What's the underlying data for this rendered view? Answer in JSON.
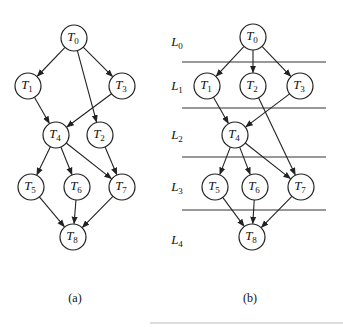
{
  "figure": {
    "panels": [
      {
        "id": "a",
        "caption": "(a)",
        "nodes": [
          {
            "id": "T0",
            "label": "T",
            "sub": "0",
            "x": 74,
            "y": 38
          },
          {
            "id": "T1",
            "label": "T",
            "sub": "1",
            "x": 28,
            "y": 86
          },
          {
            "id": "T3",
            "label": "T",
            "sub": "3",
            "x": 122,
            "y": 86
          },
          {
            "id": "T4",
            "label": "T",
            "sub": "4",
            "x": 56,
            "y": 135
          },
          {
            "id": "T2",
            "label": "T",
            "sub": "2",
            "x": 100,
            "y": 135
          },
          {
            "id": "T5",
            "label": "T",
            "sub": "5",
            "x": 31,
            "y": 187
          },
          {
            "id": "T6",
            "label": "T",
            "sub": "6",
            "x": 77,
            "y": 187
          },
          {
            "id": "T7",
            "label": "T",
            "sub": "7",
            "x": 122,
            "y": 187
          },
          {
            "id": "T8",
            "label": "T",
            "sub": "8",
            "x": 73,
            "y": 237
          }
        ],
        "edges": [
          [
            "T0",
            "T1"
          ],
          [
            "T0",
            "T3"
          ],
          [
            "T0",
            "T2"
          ],
          [
            "T1",
            "T4"
          ],
          [
            "T3",
            "T4"
          ],
          [
            "T4",
            "T5"
          ],
          [
            "T4",
            "T6"
          ],
          [
            "T4",
            "T7"
          ],
          [
            "T2",
            "T7"
          ],
          [
            "T5",
            "T8"
          ],
          [
            "T6",
            "T8"
          ],
          [
            "T7",
            "T8"
          ]
        ]
      },
      {
        "id": "b",
        "caption": "(b)",
        "levels": [
          {
            "label": "L",
            "sub": "0",
            "y": 42
          },
          {
            "label": "L",
            "sub": "1",
            "y": 86
          },
          {
            "label": "L",
            "sub": "2",
            "y": 135
          },
          {
            "label": "L",
            "sub": "3",
            "y": 187
          },
          {
            "label": "L",
            "sub": "4",
            "y": 240
          }
        ],
        "level_lines_y": [
          62,
          108,
          157,
          210
        ],
        "nodes": [
          {
            "id": "T0",
            "label": "T",
            "sub": "0",
            "x": 253,
            "y": 37
          },
          {
            "id": "T1",
            "label": "T",
            "sub": "1",
            "x": 207,
            "y": 86
          },
          {
            "id": "T2",
            "label": "T",
            "sub": "2",
            "x": 253,
            "y": 86
          },
          {
            "id": "T3",
            "label": "T",
            "sub": "3",
            "x": 300,
            "y": 86
          },
          {
            "id": "T4",
            "label": "T",
            "sub": "4",
            "x": 235,
            "y": 135
          },
          {
            "id": "T5",
            "label": "T",
            "sub": "5",
            "x": 215,
            "y": 187
          },
          {
            "id": "T6",
            "label": "T",
            "sub": "6",
            "x": 255,
            "y": 187
          },
          {
            "id": "T7",
            "label": "T",
            "sub": "7",
            "x": 301,
            "y": 187
          },
          {
            "id": "T8",
            "label": "T",
            "sub": "8",
            "x": 252,
            "y": 237
          }
        ],
        "edges": [
          [
            "T0",
            "T1"
          ],
          [
            "T0",
            "T2"
          ],
          [
            "T0",
            "T3"
          ],
          [
            "T1",
            "T4"
          ],
          [
            "T3",
            "T4"
          ],
          [
            "T2",
            "T7"
          ],
          [
            "T4",
            "T5"
          ],
          [
            "T4",
            "T6"
          ],
          [
            "T4",
            "T7"
          ],
          [
            "T5",
            "T8"
          ],
          [
            "T6",
            "T8"
          ],
          [
            "T7",
            "T8"
          ]
        ]
      }
    ]
  }
}
